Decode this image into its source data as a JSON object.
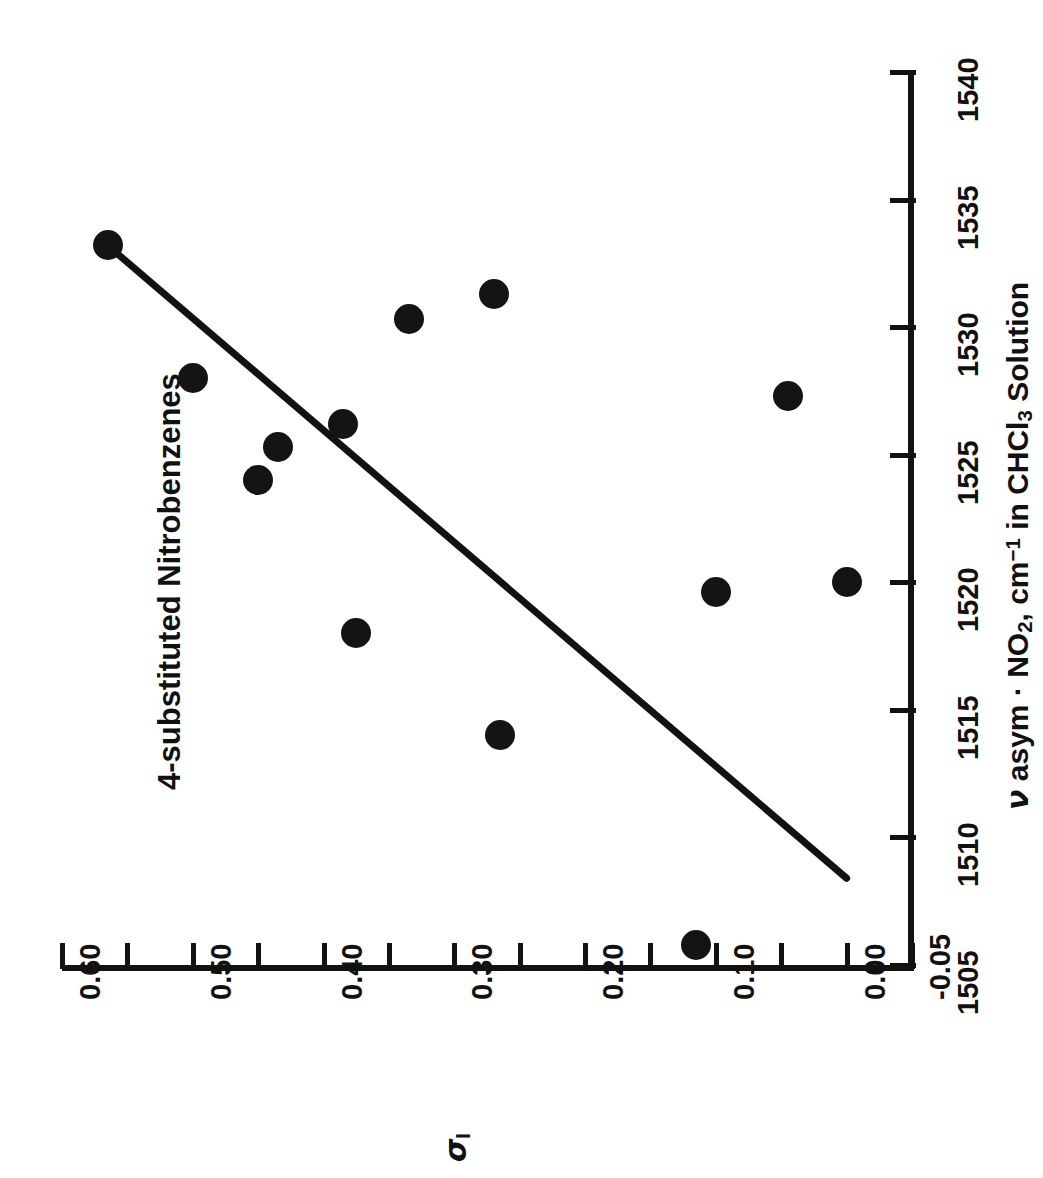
{
  "chart_data": {
    "type": "scatter",
    "title": "4-substituted Nitrobenzenes",
    "xlabel_plain": "sigma_I",
    "ylabel_plain": "nu asym - NO2, cm-1 in CHCl3 Solution",
    "orientation": "rotated-90",
    "grid": false,
    "legend": null,
    "x_axis": {
      "name": "nu asym · NO2, cm-1 in CHCl3 Solution",
      "screen_axis": "vertical-right",
      "min": 1505,
      "max": 1540,
      "tick_step": 5,
      "ticks": [
        1505,
        1510,
        1515,
        1520,
        1525,
        1530,
        1535,
        1540
      ],
      "tick_labels": [
        "1505",
        "1510",
        "1515",
        "1520",
        "1525",
        "1530",
        "1535",
        "1540"
      ]
    },
    "y_axis": {
      "name": "sigma_I",
      "screen_axis": "horizontal-bottom",
      "min": -0.05,
      "max": 0.6,
      "tick_step": 0.05,
      "ticks": [
        0.6,
        0.55,
        0.5,
        0.45,
        0.4,
        0.35,
        0.3,
        0.25,
        0.2,
        0.15,
        0.1,
        0.05,
        0.0,
        -0.05
      ],
      "labeled_ticks": [
        0.6,
        0.5,
        0.4,
        0.3,
        0.2,
        0.1,
        0.0,
        -0.05
      ],
      "tick_labels": [
        "0.60",
        "0.50",
        "0.40",
        "0.30",
        "0.20",
        "0.10",
        "0.00",
        "-0.05"
      ]
    },
    "points": [
      {
        "nu": 1533.2,
        "sigma_I": 0.565
      },
      {
        "nu": 1528.0,
        "sigma_I": 0.5
      },
      {
        "nu": 1525.3,
        "sigma_I": 0.435
      },
      {
        "nu": 1524.0,
        "sigma_I": 0.45
      },
      {
        "nu": 1526.2,
        "sigma_I": 0.385
      },
      {
        "nu": 1530.3,
        "sigma_I": 0.335
      },
      {
        "nu": 1531.3,
        "sigma_I": 0.27
      },
      {
        "nu": 1518.0,
        "sigma_I": 0.375
      },
      {
        "nu": 1514.0,
        "sigma_I": 0.265
      },
      {
        "nu": 1527.3,
        "sigma_I": 0.045
      },
      {
        "nu": 1519.6,
        "sigma_I": 0.1
      },
      {
        "nu": 1520.0,
        "sigma_I": 0.0
      },
      {
        "nu": 1505.8,
        "sigma_I": 0.115
      }
    ],
    "fit_line": {
      "kind": "linear-regression",
      "from": {
        "nu": 1533.2,
        "sigma_I": 0.565
      },
      "to": {
        "nu": 1508.4,
        "sigma_I": 0.0
      }
    },
    "marker": {
      "shape": "circle",
      "filled": true,
      "color": "#141414",
      "size_px": 30
    },
    "line_color": "#121212",
    "axis_color": "#121212",
    "background": "#ffffff"
  },
  "labels": {
    "title": "4-substituted Nitrobenzenes",
    "x_ticks": [
      "1505",
      "1510",
      "1515",
      "1520",
      "1525",
      "1530",
      "1535",
      "1540"
    ],
    "y_ticks": [
      "0.60",
      "0.50",
      "0.40",
      "0.30",
      "0.20",
      "0.10",
      "0.00",
      "-0.05"
    ],
    "sigma_axis_label": "σ",
    "sigma_axis_subscript": "I",
    "nu_axis_label_parts": {
      "nu": "ν",
      "asym": " asym · NO",
      "sub2": "2",
      "comma_cm": ", cm",
      "sup_neg1": "−1",
      "tail": " in CHCl",
      "sub3": "3",
      "solution": " Solution"
    }
  }
}
